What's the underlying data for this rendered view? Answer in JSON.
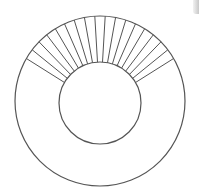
{
  "diagram": {
    "title": "",
    "stroke_color": "#555555",
    "background": "#ffffff",
    "outer_circle": {
      "cx": 100,
      "cy": 101,
      "r": 85
    },
    "inner_circle": {
      "cx": 100,
      "cy": 103,
      "r": 41
    },
    "radial_lines": {
      "count": 18,
      "start_angle_deg": 150,
      "end_angle_deg": 30
    },
    "corner_element": "scrollbar-edge"
  }
}
